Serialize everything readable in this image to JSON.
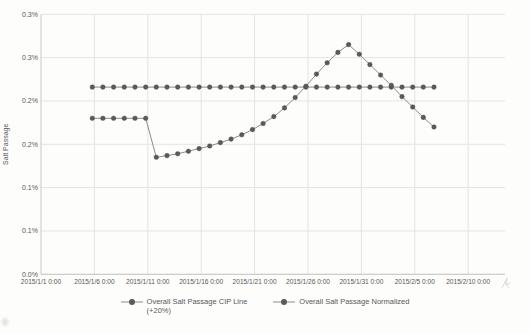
{
  "chart_data": {
    "type": "line",
    "title": "",
    "xlabel": "",
    "ylabel": "Salt Passage",
    "y_unit": "%",
    "ylim": [
      0,
      0.3
    ],
    "grid": true,
    "legend_position": "bottom",
    "x_axis_labels": [
      "2015/1/1 0:00",
      "2015/1/6 0:00",
      "2015/1/11 0:00",
      "2015/1/16 0:00",
      "2015/1/21 0:00",
      "2015/1/26 0:00",
      "2015/1/31 0:00",
      "2015/2/5 0:00",
      "2015/2/10 0:00"
    ],
    "y_ticks": [
      {
        "label": "0.3%",
        "value": 0.3
      },
      {
        "label": "0.3%",
        "value": 0.25
      },
      {
        "label": "0.2%",
        "value": 0.2
      },
      {
        "label": "0.2%",
        "value": 0.15
      },
      {
        "label": "0.1%",
        "value": 0.1
      },
      {
        "label": "0.1%",
        "value": 0.05
      },
      {
        "label": "0.0%",
        "value": 0.0
      }
    ],
    "days_after_jan1_2015": [
      4.8,
      5.8,
      6.8,
      7.8,
      8.8,
      9.8,
      10.8,
      11.8,
      12.8,
      13.8,
      14.8,
      15.8,
      16.8,
      17.8,
      18.8,
      19.8,
      20.8,
      21.8,
      22.8,
      23.8,
      24.8,
      25.8,
      26.8,
      27.8,
      28.8,
      29.8,
      30.8,
      31.8,
      32.8,
      33.8,
      34.8,
      35.8,
      36.8
    ],
    "series": [
      {
        "name": "Overall Salt Passage CIP Line (+20%)",
        "legend_lines": [
          "Overall Salt Passage CIP Line",
          "(+20%)"
        ],
        "marker_color": "#5a5a5a",
        "line_color": "#8c8c8c",
        "values": [
          0.216,
          0.216,
          0.216,
          0.216,
          0.216,
          0.216,
          0.216,
          0.216,
          0.216,
          0.216,
          0.216,
          0.216,
          0.216,
          0.216,
          0.216,
          0.216,
          0.216,
          0.216,
          0.216,
          0.216,
          0.216,
          0.216,
          0.216,
          0.216,
          0.216,
          0.216,
          0.216,
          0.216,
          0.216,
          0.216,
          0.216,
          0.216,
          0.216
        ]
      },
      {
        "name": "Overall Salt Passage Normalized",
        "legend_lines": [
          "Overall Salt Passage Normalized"
        ],
        "marker_color": "#5a5a5a",
        "line_color": "#8c8c8c",
        "values": [
          0.18,
          0.18,
          0.18,
          0.18,
          0.18,
          0.18,
          0.135,
          0.137,
          0.139,
          0.142,
          0.145,
          0.148,
          0.152,
          0.156,
          0.161,
          0.167,
          0.174,
          0.182,
          0.192,
          0.204,
          0.217,
          0.231,
          0.244,
          0.256,
          0.265,
          0.254,
          0.242,
          0.23,
          0.218,
          0.205,
          0.193,
          0.181,
          0.17
        ]
      }
    ]
  }
}
